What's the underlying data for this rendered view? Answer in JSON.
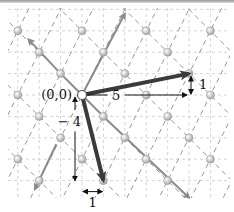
{
  "diagram": {
    "title": "",
    "origin_label": "(0,0)",
    "basis_vectors": [
      [
        1,
        -1
      ],
      [
        1,
        2
      ]
    ],
    "lattice_range": [
      -6,
      6
    ],
    "lattice_point_color": "#c8c8c8",
    "grid_color": "#c8c8c8",
    "lattice_line_color": "#8a8a8a",
    "basis_arrow_color": "#8a8a8a",
    "main_vector_color": "#3a3a3a",
    "main_vectors": [
      {
        "id": "v1",
        "to": [
          5,
          1
        ],
        "dx_label": "5",
        "dy_label": "1"
      },
      {
        "id": "v2",
        "to": [
          1,
          -4
        ],
        "dx_label": "1",
        "dy_label": "− 4"
      }
    ],
    "gray_arrows": [
      {
        "id": "a-upleft",
        "from": [
          -1,
          1
        ],
        "to": [
          -2.5,
          2.6
        ]
      },
      {
        "id": "a-downright",
        "from": [
          1,
          -1
        ],
        "to": [
          5,
          -4.8
        ]
      },
      {
        "id": "a-upright",
        "from": [
          0,
          0
        ],
        "to": [
          2,
          3.8
        ]
      },
      {
        "id": "a-downleft",
        "from": [
          -1.2,
          -2.3
        ],
        "to": [
          -2.2,
          -4.4
        ]
      }
    ]
  }
}
